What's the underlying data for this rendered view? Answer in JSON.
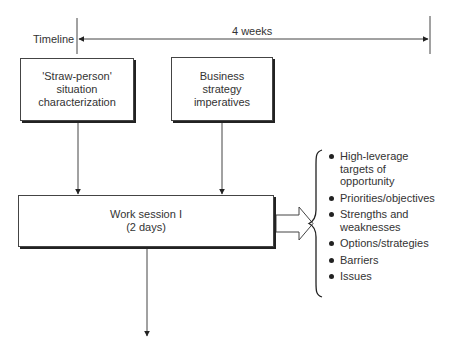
{
  "timeline": {
    "label": "Timeline",
    "duration_label": "4 weeks"
  },
  "inputs": [
    {
      "label": "'Straw-person'\nsituation\ncharacterization"
    },
    {
      "label": "Business\nstrategy\nimperatives"
    }
  ],
  "work_session": {
    "label": "Work session I\n(2 days)"
  },
  "outputs": [
    {
      "label": "High-leverage\ntargets of\nopportunity"
    },
    {
      "label": "Priorities/objectives"
    },
    {
      "label": "Strengths and\nweaknesses"
    },
    {
      "label": "Options/strategies"
    },
    {
      "label": "Barriers"
    },
    {
      "label": "Issues"
    }
  ],
  "colors": {
    "line": "#333333",
    "background": "#ffffff"
  }
}
